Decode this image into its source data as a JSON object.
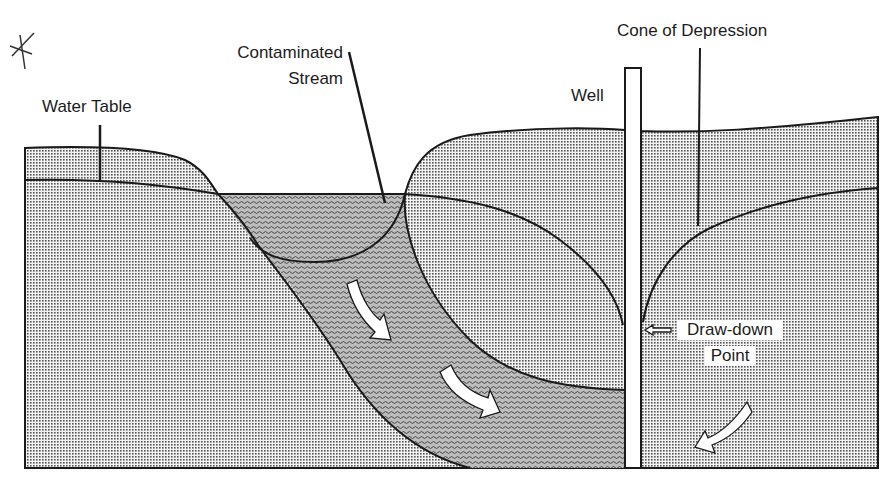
{
  "diagram": {
    "labels": {
      "water_table": "Water Table",
      "contaminated_stream_line1": "Contaminated",
      "contaminated_stream_line2": "Stream",
      "well": "Well",
      "cone_of_depression": "Cone of Depression",
      "draw_down_line1": "Draw-down",
      "draw_down_line2": "Point"
    },
    "annotations": {
      "margin_mark": "asterisk-mark"
    },
    "flow_arrows": [
      {
        "name": "plume-flow-arrow-1",
        "direction": "down-right"
      },
      {
        "name": "plume-flow-arrow-2",
        "direction": "down-right"
      },
      {
        "name": "groundwater-flow-arrow",
        "direction": "down-left"
      },
      {
        "name": "draw-down-pointer-arrow",
        "direction": "left"
      }
    ],
    "colors": {
      "line": "#1a1a1a",
      "aquifer_fill": "#d9d9d9",
      "plume_fill": "#a9a9a9",
      "background": "#ffffff"
    }
  }
}
